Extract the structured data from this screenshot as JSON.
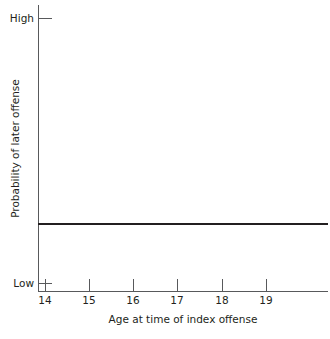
{
  "chart_data": {
    "type": "line",
    "title": "",
    "subtitle": "",
    "xlabel": "Age at time of index offense",
    "ylabel": "Probability of later offense",
    "x": [
      14,
      15,
      16,
      17,
      18,
      19
    ],
    "xtick_labels": [
      "14",
      "15",
      "16",
      "17",
      "18",
      "19"
    ],
    "xlim": [
      13.6,
      20.2
    ],
    "ylim": [
      0,
      1
    ],
    "ytick_labels": [
      "Low",
      "High"
    ],
    "ytick_values": [
      0.03,
      0.955
    ],
    "grid": false,
    "legend": null,
    "annotations": [],
    "series": [
      {
        "name": "Probability of later offense",
        "color": "#231f20",
        "style": "flat-horizontal",
        "values": [
          0.234,
          0.234,
          0.234,
          0.234,
          0.234,
          0.234
        ]
      }
    ]
  },
  "axes": {
    "y": {
      "title": "Probability of later offense",
      "ticks": [
        {
          "label": "High",
          "name": "y-tick-high"
        },
        {
          "label": "Low",
          "name": "y-tick-low"
        }
      ]
    },
    "x": {
      "title": "Age at time of index offense",
      "ticks": [
        {
          "label": "14",
          "left": 45
        },
        {
          "label": "15",
          "left": 89
        },
        {
          "label": "16",
          "left": 133
        },
        {
          "label": "17",
          "left": 177
        },
        {
          "label": "18",
          "left": 222
        },
        {
          "label": "19",
          "left": 266
        }
      ]
    }
  },
  "colors": {
    "axis": "#58595b",
    "series": "#231f20",
    "text": "#231f20",
    "background": "#ffffff"
  }
}
